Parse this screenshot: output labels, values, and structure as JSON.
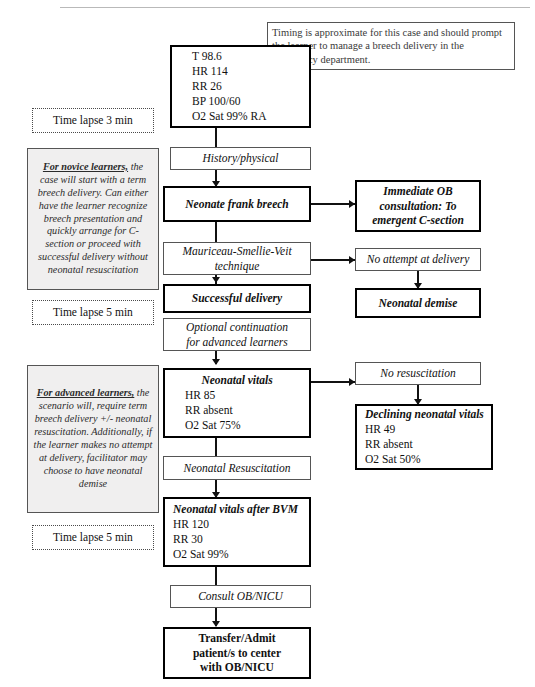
{
  "document": {
    "title": "Breech Delivery Simulation Case Flowchart"
  },
  "notes": {
    "timing_note": "Timing is approximate for this case and should prompt the learner to manage a breech delivery in the emergency department."
  },
  "timeline": {
    "lapse_1": "Time lapse 3 min",
    "lapse_2": "Time lapse 5 min",
    "lapse_3": "Time lapse 5 min"
  },
  "annotations": {
    "novice": {
      "heading": "For novice learners,",
      "body": "the case will start with a term breech delivery. Can either have the learner recognize breech presentation and quickly arrange for C-section or proceed with successful delivery without neonatal resuscitation"
    },
    "advanced": {
      "heading": "For advanced learners,",
      "body": "the scenario will, require term breech delivery +/- neonatal resuscitation. Additionally, if the learner makes no attempt at delivery, facilitator may choose to have neonatal demise"
    }
  },
  "flow": {
    "initial_vitals": {
      "lines": [
        "T 98.6",
        "HR 114",
        "RR 26",
        "BP 100/60",
        "O2 Sat 99% RA"
      ]
    },
    "history_physical": "History/physical",
    "neonate_frank_breech": "Neonate frank breech",
    "immediate_ob": {
      "lines": [
        "Immediate OB",
        "consultation: To",
        "emergent C-section"
      ]
    },
    "msv_technique": {
      "lines": [
        "Mauriceau-Smellie-Veit",
        "technique"
      ]
    },
    "no_attempt": "No attempt at delivery",
    "successful_delivery": "Successful delivery",
    "neonatal_demise": "Neonatal demise",
    "optional_continuation": {
      "lines": [
        "Optional continuation",
        "for advanced learners"
      ]
    },
    "neonatal_vitals": {
      "title": "Neonatal vitals",
      "lines": [
        "HR 85",
        "RR absent",
        "O2 Sat 75%"
      ]
    },
    "no_resuscitation": "No resuscitation",
    "declining_vitals": {
      "title": "Declining neonatal vitals",
      "lines": [
        "HR 49",
        "RR absent",
        "O2 Sat 50%"
      ]
    },
    "neonatal_resuscitation": "Neonatal Resuscitation",
    "vitals_after_bvm": {
      "title": "Neonatal vitals after BVM",
      "lines": [
        "HR 120",
        "RR 30",
        "O2 Sat 99%"
      ]
    },
    "consult": "Consult OB/NICU",
    "transfer": {
      "lines": [
        "Transfer/Admit",
        "patient/s to center",
        "with OB/NICU"
      ]
    }
  },
  "colors": {
    "stroke": "#111111",
    "thin_stroke": "#555555",
    "shaded_fill": "#f0efef",
    "page_bg": "#ffffff"
  }
}
